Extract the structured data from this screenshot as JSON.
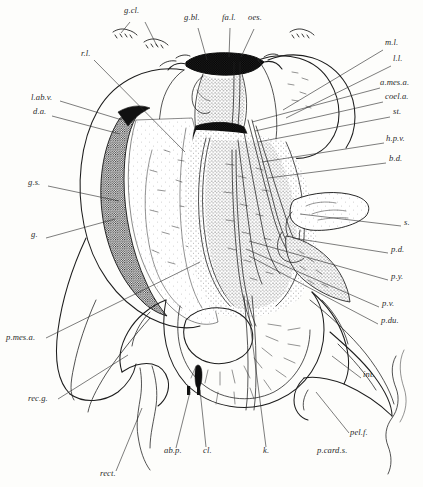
{
  "figure": {
    "type": "anatomical-illustration",
    "style": "stippled pen-and-ink line engraving",
    "background_color": "#fdfdfb",
    "ink_color": "#1d1d1d"
  },
  "labels": [
    {
      "id": "g.cl",
      "text": "g.cl.",
      "x": 124,
      "y": 12
    },
    {
      "id": "g.bl",
      "text": "g.bl.",
      "x": 184,
      "y": 19
    },
    {
      "id": "fa.l",
      "text": "fa.l.",
      "x": 222,
      "y": 19
    },
    {
      "id": "oes",
      "text": "oes.",
      "x": 248,
      "y": 19
    },
    {
      "id": "m.l",
      "text": "m.l.",
      "x": 385,
      "y": 44
    },
    {
      "id": "l.l",
      "text": "l.l.",
      "x": 393,
      "y": 60
    },
    {
      "id": "r.l",
      "text": "r.l.",
      "x": 81,
      "y": 55
    },
    {
      "id": "a.mes.a",
      "text": "a.mes.a.",
      "x": 382,
      "y": 84
    },
    {
      "id": "coel.a",
      "text": "coel.a.",
      "x": 385,
      "y": 98
    },
    {
      "id": "l.ab.v",
      "text": "l.ab.v.",
      "x": 31,
      "y": 99
    },
    {
      "id": "st",
      "text": "st.",
      "x": 393,
      "y": 113
    },
    {
      "id": "d.a",
      "text": "d.a.",
      "x": 33,
      "y": 113
    },
    {
      "id": "h.p.v",
      "text": "h.p.v.",
      "x": 386,
      "y": 140
    },
    {
      "id": "b.d",
      "text": "b.d.",
      "x": 389,
      "y": 160
    },
    {
      "id": "g.s",
      "text": "g.s.",
      "x": 28,
      "y": 184
    },
    {
      "id": "s",
      "text": "s.",
      "x": 404,
      "y": 224
    },
    {
      "id": "g",
      "text": "g.",
      "x": 31,
      "y": 236
    },
    {
      "id": "p.d",
      "text": "p.d.",
      "x": 391,
      "y": 251
    },
    {
      "id": "p.y",
      "text": "p.y.",
      "x": 391,
      "y": 278
    },
    {
      "id": "p.v",
      "text": "p.v.",
      "x": 382,
      "y": 305
    },
    {
      "id": "p.mes.a",
      "text": "p.mes.a.",
      "x": 6,
      "y": 339
    },
    {
      "id": "p.du",
      "text": "p.du.",
      "x": 381,
      "y": 322
    },
    {
      "id": "int",
      "text": "int.",
      "x": 363,
      "y": 376
    },
    {
      "id": "rec.g",
      "text": "rec.g.",
      "x": 28,
      "y": 400
    },
    {
      "id": "pel.f",
      "text": "pel.f.",
      "x": 350,
      "y": 434
    },
    {
      "id": "ab.p",
      "text": "ab.p.",
      "x": 164,
      "y": 452
    },
    {
      "id": "cl",
      "text": "cl.",
      "x": 203,
      "y": 452
    },
    {
      "id": "k",
      "text": "k.",
      "x": 263,
      "y": 452
    },
    {
      "id": "p.card.s",
      "text": "p.card.s.",
      "x": 317,
      "y": 452
    },
    {
      "id": "rect",
      "text": "rect.",
      "x": 100,
      "y": 475
    }
  ],
  "leader_lines": [
    {
      "from": "g.cl",
      "d": "M145,22 L157,46"
    },
    {
      "from": "g.cl2",
      "d": "M130,22 L121,34"
    },
    {
      "from": "g.bl",
      "d": "M198,28 L207,60"
    },
    {
      "from": "fa.l",
      "d": "M230,28 L229,57"
    },
    {
      "from": "oes",
      "d": "M254,29 L241,57"
    },
    {
      "from": "m.l",
      "d": "M383,50 L283,110"
    },
    {
      "from": "l.l",
      "d": "M391,66 L286,118"
    },
    {
      "from": "r.l",
      "d": "M94,60 L185,152"
    },
    {
      "from": "a.mes.a",
      "d": "M380,88 L252,122"
    },
    {
      "from": "coel.a",
      "d": "M383,102 L255,131"
    },
    {
      "from": "l.ab.v",
      "d": "M60,101 L120,119"
    },
    {
      "from": "st",
      "d": "M390,117 L258,142"
    },
    {
      "from": "d.a",
      "d": "M52,116 L118,133"
    },
    {
      "from": "h.p.v",
      "d": "M384,143 L262,162"
    },
    {
      "from": "b.d",
      "d": "M386,163 L268,178"
    },
    {
      "from": "g.s",
      "d": "M48,186 L119,201"
    },
    {
      "from": "s",
      "d": "M401,226 L300,214"
    },
    {
      "from": "g",
      "d": "M46,238 L115,219"
    },
    {
      "from": "p.d",
      "d": "M388,253 L293,238"
    },
    {
      "from": "p.y",
      "d": "M388,280 L249,241"
    },
    {
      "from": "p.v",
      "d": "M379,307 L246,249"
    },
    {
      "from": "p.mes.a",
      "d": "M46,338 L200,262"
    },
    {
      "from": "p.du",
      "d": "M378,324 L249,256"
    },
    {
      "from": "int",
      "d": "M361,378 L330,356"
    },
    {
      "from": "rec.g",
      "d": "M58,399 L128,355"
    },
    {
      "from": "pel.f",
      "d": "M349,433 L316,392"
    },
    {
      "from": "ab.p",
      "d": "M176,448 L190,392"
    },
    {
      "from": "cl",
      "d": "M206,447 L200,390"
    },
    {
      "from": "k",
      "d": "M266,447 L247,300"
    },
    {
      "from": "rect",
      "d": "M116,471 L142,408"
    }
  ],
  "structure_names": {
    "g.cl": "gastric caeca marker",
    "g.bl": "gall bladder",
    "fa.l": "falciform ligament",
    "oes": "oesophagus",
    "r.l": "right lobe of liver",
    "m.l": "median lobe of liver",
    "l.l": "left lobe of liver",
    "a.mes.a": "anterior mesenteric artery",
    "coel.a": "coeliac artery",
    "st": "stomach",
    "h.p.v": "hepatic portal vein",
    "b.d": "bile duct",
    "l.ab.v": "lateral abdominal vein",
    "d.a": "dorsal aorta",
    "g.s": "gall bladder sac",
    "g": "gall bladder",
    "s": "spleen",
    "p.d": "pancreatic duct",
    "p.y": "pylorus",
    "p.v": "portal vein",
    "p.du": "pancreatic duodenum",
    "p.mes.a": "posterior mesenteric artery",
    "int": "intestine",
    "rec.g": "rectal gland",
    "pel.f": "pelvic fin",
    "ab.p": "abdominal pore",
    "cl": "cloaca",
    "k": "kidney",
    "p.card.s": "posterior cardinal sinus",
    "rect": "rectum"
  }
}
